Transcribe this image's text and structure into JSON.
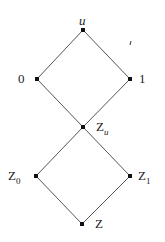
{
  "diagram": {
    "type": "lattice",
    "nodes": [
      {
        "id": "u",
        "label": "u",
        "x": 83,
        "y": 30
      },
      {
        "id": "0",
        "label": "0",
        "x": 37,
        "y": 79
      },
      {
        "id": "1",
        "label": "1",
        "x": 130,
        "y": 79
      },
      {
        "id": "Zu",
        "label": "Z",
        "sub": "u",
        "x": 83,
        "y": 127
      },
      {
        "id": "Z0",
        "label": "Z",
        "sub": "0",
        "x": 36,
        "y": 176
      },
      {
        "id": "Z1",
        "label": "Z",
        "sub": "1",
        "x": 130,
        "y": 176
      },
      {
        "id": "Z",
        "label": "Z",
        "x": 82,
        "y": 224
      }
    ],
    "edges": [
      [
        "u",
        "0"
      ],
      [
        "u",
        "1"
      ],
      [
        "0",
        "Zu"
      ],
      [
        "1",
        "Zu"
      ],
      [
        "Zu",
        "Z0"
      ],
      [
        "Zu",
        "Z1"
      ],
      [
        "Z0",
        "Z"
      ],
      [
        "Z1",
        "Z"
      ]
    ],
    "colors": {
      "line": "#555555",
      "node": "#111111",
      "text": "#222222"
    }
  }
}
